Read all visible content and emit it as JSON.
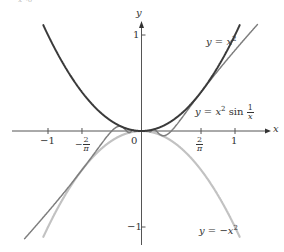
{
  "header_fragment": "x→0",
  "chart_data": {
    "type": "line",
    "title": "",
    "xlabel": "x",
    "ylabel": "y",
    "xlim": [
      -1.1,
      1.25
    ],
    "ylim": [
      -1.15,
      1.12
    ],
    "grid": false,
    "x_ticks": [
      {
        "value": -1,
        "label": "−1"
      },
      {
        "value": -0.6366,
        "label": "−2/π"
      },
      {
        "value": 0,
        "label": "0"
      },
      {
        "value": 0.6366,
        "label": "2/π"
      },
      {
        "value": 1,
        "label": "1"
      }
    ],
    "y_ticks": [
      {
        "value": 1,
        "label": "1"
      },
      {
        "value": -1,
        "label": "−1"
      }
    ],
    "series": [
      {
        "name": "y = x^2",
        "function": "x^2",
        "domain": [
          -1.05,
          1.05
        ],
        "color": "#3a3a3a",
        "label": "y = x²"
      },
      {
        "name": "y = x^2 sin(1/x)",
        "function": "x^2*sin(1/x)",
        "domain": [
          -1.25,
          1.24
        ],
        "color": "#7d7d7d",
        "label": "y = x² sin 1/x"
      },
      {
        "name": "y = -x^2",
        "function": "-x^2",
        "domain": [
          -1.05,
          1.05
        ],
        "color": "#c2c2c2",
        "label": "y = −x²"
      }
    ],
    "annotations": [
      {
        "text": "y = x²",
        "x": 0.95,
        "y": 0.92
      },
      {
        "text": "y = x² sin (1/x)",
        "x": 0.88,
        "y": 0.2
      },
      {
        "text": "y = −x²",
        "x": 0.95,
        "y": -1.0
      }
    ]
  },
  "labels": {
    "x_axis": "x",
    "y_axis": "y",
    "tick_x_neg1": "−1",
    "tick_x_neg2pi_sign": "−",
    "tick_x_2": "2",
    "tick_x_pi": "π",
    "tick_x_zero": "0",
    "tick_x_1": "1",
    "tick_y_1": "1",
    "tick_y_neg1": "−1",
    "curve1_prefix": "y = ",
    "curve1_var": "x",
    "curve1_exp": "2",
    "curve2_prefix": "y = ",
    "curve2_var": "x",
    "curve2_exp": "2",
    "curve2_fn": " sin ",
    "curve2_num": "1",
    "curve2_den": "x",
    "curve3_prefix": "y = −",
    "curve3_var": "x",
    "curve3_exp": "2"
  }
}
